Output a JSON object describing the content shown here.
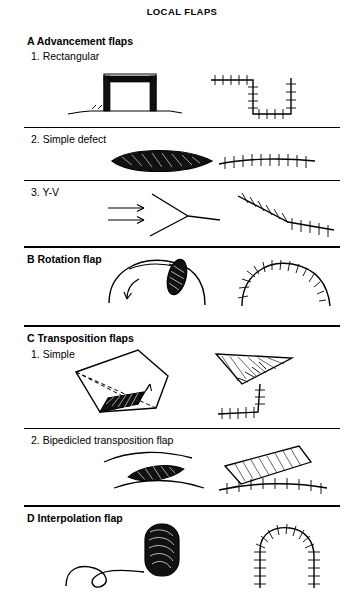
{
  "page": {
    "title": "LOCAL FLAPS",
    "width": 364,
    "height": 608,
    "background": "#ffffff",
    "ink": "#000000"
  },
  "sections": [
    {
      "id": "a",
      "letter": "A",
      "label": "A  Advancement flaps",
      "items": [
        {
          "id": "a1",
          "label": "1.  Rectangular"
        },
        {
          "id": "a2",
          "label": "2.  Simple defect"
        },
        {
          "id": "a3",
          "label": "3.  Y-V"
        }
      ]
    },
    {
      "id": "b",
      "letter": "B",
      "label": "B   Rotation flap",
      "items": []
    },
    {
      "id": "c",
      "letter": "C",
      "label": "C  Transposition flaps",
      "items": [
        {
          "id": "c1",
          "label": "1.  Simple"
        },
        {
          "id": "c2",
          "label": "2.  Bipedicled transposition flap"
        }
      ]
    },
    {
      "id": "d",
      "letter": "D",
      "label": "D   Interpolation flap",
      "items": []
    }
  ],
  "figure": {
    "caption_note": "Line drawings of surgical local flap techniques with pre-operative design on the left and sutured result on the right of each row.",
    "columns": [
      "design",
      "sutured-result"
    ]
  }
}
